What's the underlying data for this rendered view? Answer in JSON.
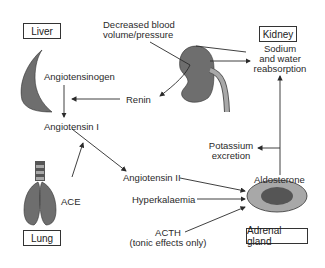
{
  "organs": {
    "liver": "Liver",
    "kidney": "Kidney",
    "lung": "Lung",
    "adrenal": "Adrenal gland"
  },
  "labels": {
    "decreased_bp_line1": "Decreased blood",
    "decreased_bp_line2": "volume/pressure",
    "angiotensinogen": "Angiotensinogen",
    "renin": "Renin",
    "angiotensin_i": "Angiotensin I",
    "ace": "ACE",
    "angiotensin_ii": "Angiotensin II",
    "hyperkalaemia": "Hyperkalaemia",
    "acth_line1": "ACTH",
    "acth_line2": "(tonic effects only)",
    "aldosterone": "Aldosterone",
    "potassium_line1": "Potassium",
    "potassium_line2": "excretion",
    "sodium_line1": "Sodium",
    "sodium_line2": "and water",
    "sodium_line3": "reabsorption"
  },
  "colors": {
    "organ_fill": "#6e6e6e",
    "organ_light": "#a8a8a8",
    "line": "#2a2a2a"
  }
}
